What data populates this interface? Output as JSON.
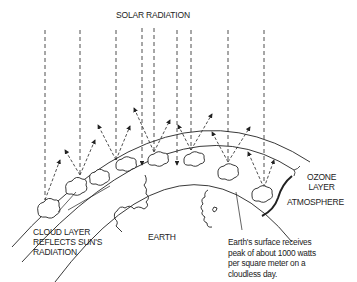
{
  "diagram": {
    "labels": {
      "solar_radiation": "SOLAR RADIATION",
      "ozone_layer": "OZONE\nLAYER",
      "atmosphere": "ATMOSPHERE",
      "cloud_layer": "CLOUD LAYER\nREFLECTS SUN'S\nRADIATION",
      "earth": "EARTH",
      "surface_note": "Earth's surface receives\npeak of about 1000 watts\nper square meter on a\ncloudless day."
    },
    "colors": {
      "line": "#222222",
      "background": "#ffffff"
    },
    "elements": [
      "solar-ray-dashed",
      "reflected-ray-arrow",
      "cloud",
      "ozone-arc",
      "atmosphere-arc",
      "earth-surface-arc",
      "coastline"
    ]
  }
}
